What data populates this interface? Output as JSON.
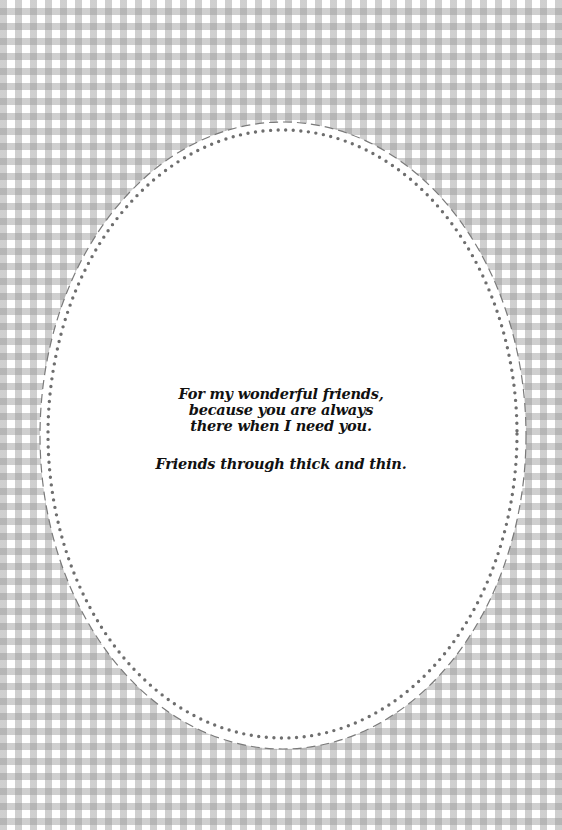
{
  "card": {
    "background_pattern": "gingham",
    "colors": {
      "background": "#ffffff",
      "check_band": "#c8c8c8",
      "check_cross": "#a8a8a8",
      "oval_fill": "#ffffff",
      "dashed_border": "#7a7a7a",
      "dotted_border": "#6e6e6e",
      "text": "#111111"
    },
    "frame": {
      "shape": "oval",
      "outer_border": "dashed",
      "inner_border": "dotted"
    },
    "message": {
      "lines": [
        "For my wonderful friends,",
        "because you are always",
        "there when I need you."
      ],
      "closing": "Friends through thick and thin."
    }
  }
}
